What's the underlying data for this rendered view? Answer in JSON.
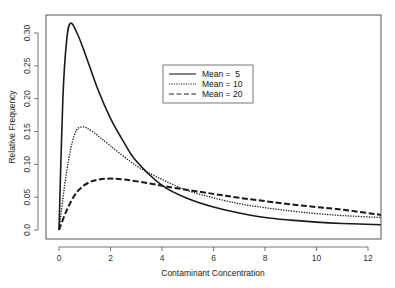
{
  "chart_data": {
    "type": "line",
    "title": "",
    "xlabel": "Contaminant Concentration",
    "ylabel": "Relative Frequency",
    "xlim": [
      -0.5,
      12.5
    ],
    "ylim": [
      0,
      0.32
    ],
    "xticks": [
      0,
      2,
      4,
      6,
      8,
      10,
      12
    ],
    "yticks": [
      0.0,
      0.05,
      0.1,
      0.15,
      0.2,
      0.25,
      0.3
    ],
    "ytick_labels": [
      "0.0",
      "0.05",
      "0.10",
      "0.15",
      "0.20",
      "0.25",
      "0.30"
    ],
    "xtick_labels": [
      "0",
      "2",
      "4",
      "6",
      "8",
      "10",
      "12"
    ],
    "grid": false,
    "legend_position": "upper center",
    "series": [
      {
        "name": "Mean =  5",
        "style": "solid",
        "x": [
          0,
          0.15,
          0.3,
          0.45,
          0.7,
          1,
          1.5,
          2,
          2.5,
          3,
          4,
          5,
          6,
          7,
          8,
          9,
          10,
          11,
          12.5
        ],
        "y": [
          0,
          0.2,
          0.29,
          0.315,
          0.3,
          0.27,
          0.215,
          0.17,
          0.135,
          0.105,
          0.068,
          0.048,
          0.035,
          0.026,
          0.019,
          0.015,
          0.012,
          0.01,
          0.008
        ]
      },
      {
        "name": "Mean = 10",
        "style": "dotted",
        "x": [
          0,
          0.3,
          0.6,
          0.9,
          1.3,
          2,
          3,
          4,
          5,
          6,
          7,
          8,
          9,
          10,
          11,
          12.5
        ],
        "y": [
          0,
          0.09,
          0.145,
          0.157,
          0.15,
          0.128,
          0.098,
          0.077,
          0.06,
          0.049,
          0.04,
          0.034,
          0.029,
          0.025,
          0.022,
          0.019
        ]
      },
      {
        "name": "Mean = 20",
        "style": "dashed",
        "x": [
          0,
          0.3,
          0.7,
          1.2,
          1.8,
          2.5,
          3.5,
          4.5,
          6,
          7,
          8,
          9,
          10,
          11,
          12.5
        ],
        "y": [
          0,
          0.03,
          0.058,
          0.073,
          0.078,
          0.077,
          0.071,
          0.064,
          0.055,
          0.049,
          0.044,
          0.039,
          0.035,
          0.031,
          0.023
        ]
      }
    ]
  },
  "legend": {
    "items": [
      "Mean =  5",
      "Mean = 10",
      "Mean = 20"
    ]
  },
  "axes": {
    "xlabel": "Contaminant Concentration",
    "ylabel": "Relative Frequency"
  }
}
